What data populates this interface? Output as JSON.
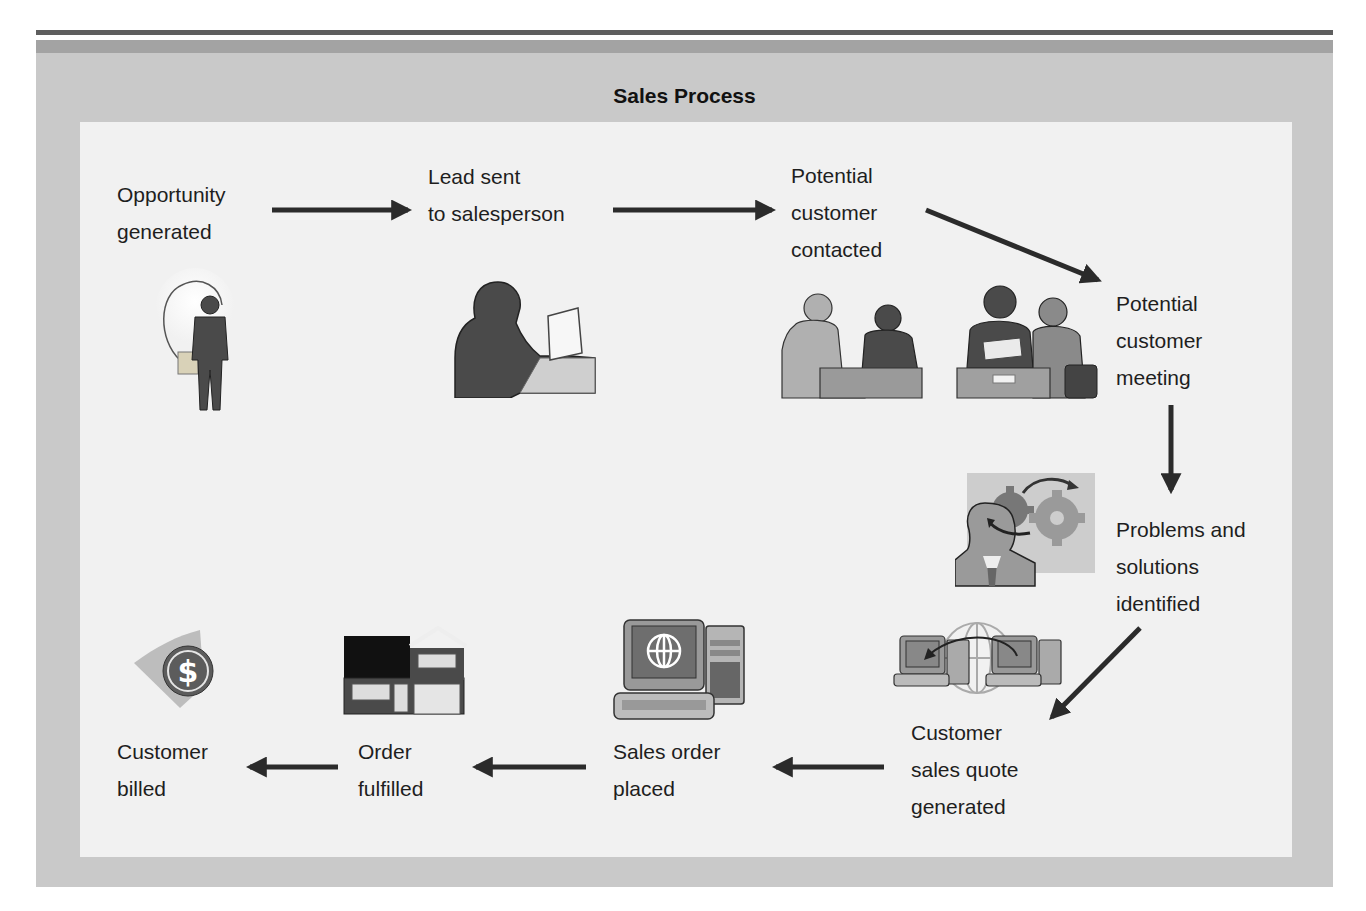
{
  "title": "Sales Process",
  "steps": [
    {
      "id": "opportunity",
      "lines": [
        "Opportunity",
        "generated"
      ],
      "icon": "lightbulb-person-icon"
    },
    {
      "id": "lead",
      "lines": [
        "Lead sent",
        "to salesperson"
      ],
      "icon": "person-laptop-icon"
    },
    {
      "id": "contacted",
      "lines": [
        "Potential",
        "customer",
        "contacted"
      ],
      "icon": "two-people-talking-icon"
    },
    {
      "id": "meeting",
      "lines": [
        "Potential",
        "customer",
        "meeting"
      ],
      "icon": "meeting-table-icon"
    },
    {
      "id": "problems",
      "lines": [
        "Problems and",
        "solutions",
        "identified"
      ],
      "icon": "person-gears-icon"
    },
    {
      "id": "quote",
      "lines": [
        "Customer",
        "sales quote",
        "generated"
      ],
      "icon": "networked-computers-icon"
    },
    {
      "id": "order",
      "lines": [
        "Sales order",
        "placed"
      ],
      "icon": "computer-globe-icon"
    },
    {
      "id": "fulfilled",
      "lines": [
        "Order",
        "fulfilled"
      ],
      "icon": "house-icon"
    },
    {
      "id": "billed",
      "lines": [
        "Customer",
        "billed"
      ],
      "icon": "dollar-coin-icon"
    }
  ],
  "arrows": [
    {
      "from": "opportunity",
      "to": "lead",
      "direction": "right"
    },
    {
      "from": "lead",
      "to": "contacted",
      "direction": "right"
    },
    {
      "from": "contacted",
      "to": "meeting",
      "direction": "down-right"
    },
    {
      "from": "meeting",
      "to": "problems",
      "direction": "down"
    },
    {
      "from": "problems",
      "to": "quote",
      "direction": "down-left"
    },
    {
      "from": "quote",
      "to": "order",
      "direction": "left"
    },
    {
      "from": "order",
      "to": "fulfilled",
      "direction": "left"
    },
    {
      "from": "fulfilled",
      "to": "billed",
      "direction": "left"
    }
  ],
  "colors": {
    "frame": "#c9c9c9",
    "frame_band": "#a3a3a3",
    "panel": "#f1f1f1",
    "arrow": "#2b2b2b",
    "silhouette_dark": "#4a4a4a",
    "silhouette_mid": "#8a8a8a",
    "silhouette_light": "#b5b5b5"
  }
}
